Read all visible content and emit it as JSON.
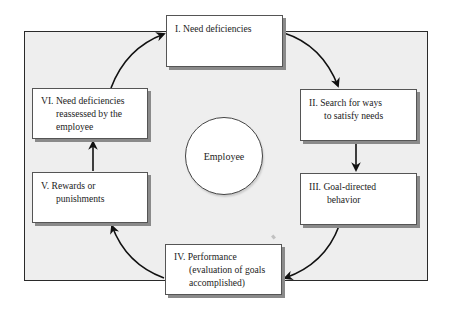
{
  "diagram": {
    "type": "cycle",
    "center": {
      "label": "Employee"
    },
    "steps": [
      {
        "id": "I",
        "lines": [
          "I. Need deficiencies"
        ]
      },
      {
        "id": "II",
        "lines": [
          "II. Search for ways",
          "to satisfy needs"
        ]
      },
      {
        "id": "III",
        "lines": [
          "III. Goal-directed",
          "behavior"
        ]
      },
      {
        "id": "IV",
        "lines": [
          "IV. Performance",
          "(evaluation of goals",
          "accomplished)"
        ]
      },
      {
        "id": "V",
        "lines": [
          "V. Rewards or",
          "punishments"
        ]
      },
      {
        "id": "VI",
        "lines": [
          "VI. Need deficiencies",
          "reassessed by the",
          "employee"
        ]
      }
    ],
    "flow": [
      {
        "from": "I",
        "to": "II"
      },
      {
        "from": "II",
        "to": "III"
      },
      {
        "from": "III",
        "to": "IV"
      },
      {
        "from": "IV",
        "to": "V"
      },
      {
        "from": "V",
        "to": "VI"
      },
      {
        "from": "VI",
        "to": "I"
      }
    ],
    "colors": {
      "frame_fill": "#eeeeee",
      "frame_border": "#2a2a2a",
      "box_fill": "#ffffff",
      "box_shadow": "#8a8a8a",
      "arrow": "#111111"
    }
  }
}
